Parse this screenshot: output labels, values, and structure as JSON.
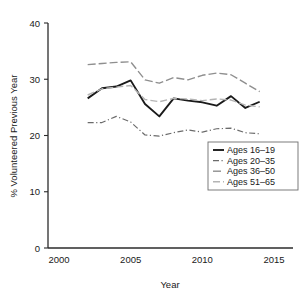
{
  "chart_data": {
    "type": "line",
    "title": "",
    "xlabel": "Year",
    "ylabel": "% Volunteered Previous Year",
    "xlim": [
      2000,
      2015
    ],
    "ylim": [
      0,
      40
    ],
    "xticks": [
      "2000",
      "2005",
      "2010",
      "2015"
    ],
    "yticks": [
      "0",
      "10",
      "20",
      "30",
      "40"
    ],
    "grid": false,
    "legend_position": "lower-right",
    "x": [
      2002,
      2003,
      2004,
      2005,
      2006,
      2007,
      2008,
      2009,
      2010,
      2011,
      2012,
      2013,
      2014
    ],
    "series": [
      {
        "name": "Ages 16–19",
        "style": "solid",
        "color": "#1a1a1a",
        "width": 1.9,
        "values": [
          26.6,
          28.4,
          28.7,
          29.8,
          25.6,
          23.4,
          26.6,
          26.2,
          25.9,
          25.3,
          27.0,
          24.9,
          26.0
        ]
      },
      {
        "name": "Ages 20–35",
        "style": "dashdot",
        "color": "#6b6b6b",
        "width": 1.2,
        "values": [
          22.3,
          22.3,
          23.4,
          22.4,
          20.1,
          19.9,
          20.5,
          21.0,
          20.6,
          21.2,
          21.3,
          20.5,
          20.3
        ]
      },
      {
        "name": "Ages 36–50",
        "style": "longdash",
        "color": "#8f8f8f",
        "width": 1.4,
        "values": [
          32.6,
          32.8,
          33.0,
          33.1,
          29.9,
          29.3,
          30.3,
          29.9,
          30.7,
          31.1,
          30.8,
          29.3,
          27.8
        ]
      },
      {
        "name": "Ages 51–65",
        "style": "dashed",
        "color": "#b4b4b4",
        "width": 1.4,
        "values": [
          27.2,
          28.3,
          28.6,
          28.9,
          26.4,
          26.0,
          26.6,
          26.5,
          26.2,
          26.5,
          26.3,
          25.4,
          25.1
        ]
      }
    ]
  },
  "legend": {
    "items": [
      {
        "label": "Ages 16–19"
      },
      {
        "label": "Ages 20–35"
      },
      {
        "label": "Ages 36–50"
      },
      {
        "label": "Ages 51–65"
      }
    ]
  }
}
